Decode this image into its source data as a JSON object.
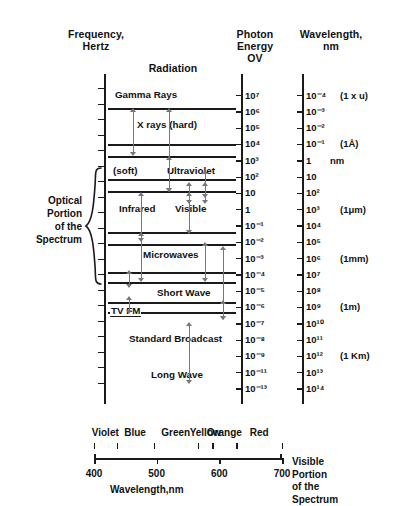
{
  "headers": {
    "frequency": "Frequency,\nHertz",
    "radiation": "Radiation",
    "photon_energy": "Photon\nEnergy\nOV",
    "wavelength": "Wavelength,\nnm"
  },
  "optical_brace": {
    "label": "Optical\nPortion\nof the\nSpectrum",
    "from_exponent": 17,
    "to_exponent": 11
  },
  "chart_data": {
    "type": "table",
    "orientation": "vertical-log-scales",
    "scales": [
      {
        "name": "frequency",
        "label": "Frequency, Hertz",
        "unit": "Hz",
        "ticks": [
          {
            "value": "10^22",
            "text": "",
            "note": ""
          },
          {
            "value": "10^21",
            "text": "10²¹",
            "note": ""
          },
          {
            "value": "10^20",
            "text": "",
            "note": ""
          },
          {
            "value": "10^19",
            "text": "10¹⁹",
            "note": ""
          },
          {
            "value": "10^18",
            "text": "",
            "note": ""
          },
          {
            "value": "10^17",
            "text": "10¹⁷",
            "note": ""
          },
          {
            "value": "10^16",
            "text": "",
            "note": ""
          },
          {
            "value": "10^15",
            "text": "10¹⁵",
            "note": ""
          },
          {
            "value": "10^14",
            "text": "",
            "note": ""
          },
          {
            "value": "10^13",
            "text": "10¹³",
            "note": ""
          },
          {
            "value": "10^12",
            "text": "",
            "note": ""
          },
          {
            "value": "10^11",
            "text": "10¹¹",
            "note": ""
          },
          {
            "value": "10^10",
            "text": "",
            "note": ""
          },
          {
            "value": "10^9",
            "text": "10⁹",
            "note": ""
          },
          {
            "value": "10^8",
            "text": "",
            "note": ""
          },
          {
            "value": "10^7",
            "text": "10⁷",
            "note": ""
          },
          {
            "value": "10^6",
            "text": "10⁶",
            "note": "(1 MHz)"
          },
          {
            "value": "10^5",
            "text": "10⁵",
            "note": ""
          },
          {
            "value": "10^4",
            "text": "",
            "note": ""
          },
          {
            "value": "10^3",
            "text": "10³",
            "note": "(1 kHz)"
          }
        ]
      },
      {
        "name": "photon_energy",
        "label": "Photon Energy OV",
        "unit": "eV",
        "ticks": [
          "10⁷",
          "10⁶",
          "10⁵",
          "10⁴",
          "10³",
          "10²",
          "10",
          "1",
          "10⁻¹",
          "10⁻²",
          "10⁻³",
          "10⁻⁴",
          "10⁻⁵",
          "10⁻⁶",
          "10⁻⁷",
          "10⁻⁸",
          "10⁻⁹",
          "10⁻¹¹",
          "10⁻¹³"
        ]
      },
      {
        "name": "wavelength",
        "label": "Wavelength, nm",
        "unit": "nm",
        "ticks": [
          {
            "text": "10⁻⁴",
            "note": "(1 x u)"
          },
          {
            "text": "10⁻³",
            "note": ""
          },
          {
            "text": "10⁻²",
            "note": ""
          },
          {
            "text": "10⁻¹",
            "note": "(1Å)"
          },
          {
            "text": "1",
            "note": "nm"
          },
          {
            "text": "10",
            "note": ""
          },
          {
            "text": "10²",
            "note": ""
          },
          {
            "text": "10³",
            "note": "(1μm)"
          },
          {
            "text": "10⁴",
            "note": ""
          },
          {
            "text": "10⁵",
            "note": ""
          },
          {
            "text": "10⁶",
            "note": "(1mm)"
          },
          {
            "text": "10⁷",
            "note": ""
          },
          {
            "text": "10⁸",
            "note": ""
          },
          {
            "text": "10⁹",
            "note": "(1m)"
          },
          {
            "text": "10¹⁰",
            "note": ""
          },
          {
            "text": "10¹¹",
            "note": ""
          },
          {
            "text": "10¹²",
            "note": "(1 Km)"
          },
          {
            "text": "10¹³",
            "note": ""
          },
          {
            "text": "10¹⁴",
            "note": ""
          }
        ]
      }
    ],
    "bands": [
      {
        "name": "Gamma Rays",
        "label": "Gamma Rays",
        "underline": false
      },
      {
        "name": "X rays (hard)",
        "label": "X rays (hard)",
        "underline": false
      },
      {
        "name": "X rays (soft)",
        "label": "(soft)",
        "underline": false
      },
      {
        "name": "Ultraviolet",
        "label": "Ultraviolet",
        "underline": false
      },
      {
        "name": "Infrared",
        "label": "Infrared",
        "underline": false
      },
      {
        "name": "Visible",
        "label": "Visible",
        "underline": false
      },
      {
        "name": "Microwaves",
        "label": "Microwaves",
        "underline": false
      },
      {
        "name": "Short Wave",
        "label": "Short Wave",
        "underline": false
      },
      {
        "name": "TV FM",
        "label": "TV FM",
        "underline": true
      },
      {
        "name": "Standard Broadcast",
        "label": "Standard Broadcast",
        "underline": false
      },
      {
        "name": "Long Wave",
        "label": "Long Wave",
        "underline": false
      }
    ]
  },
  "visible_spectrum": {
    "xlabel": "Wavelength,nm",
    "side_label": "Visible\nPortion\nof the\nSpectrum",
    "axis_min": 400,
    "axis_max": 700,
    "tick_values": [
      400,
      500,
      600,
      700
    ],
    "tick_labels": [
      "400",
      "500",
      "600",
      "700"
    ],
    "colors": [
      {
        "name": "Violet",
        "start": 400,
        "end": 436
      },
      {
        "name": "Blue",
        "start": 436,
        "end": 495
      },
      {
        "name": "Green",
        "start": 495,
        "end": 566
      },
      {
        "name": "Yellow",
        "start": 566,
        "end": 589
      },
      {
        "name": "Orange",
        "start": 589,
        "end": 627
      },
      {
        "name": "Red",
        "start": 627,
        "end": 700
      }
    ]
  }
}
